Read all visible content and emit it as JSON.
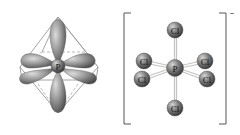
{
  "figure": {
    "left_panel": {
      "description": "sp3d2 hybrid orbitals of phosphorus in octahedral arrangement",
      "center_atom": "P",
      "orbital_color": "#8c8c8c",
      "edge_color": "#9a9a9a"
    },
    "right_panel": {
      "description": "Octahedral hexachlorophosphate ion",
      "center_atom": "P",
      "ligands": [
        "Cl",
        "Cl",
        "Cl",
        "Cl",
        "Cl",
        "Cl"
      ],
      "charge": "–",
      "atom_color": "#7a7a7a",
      "bond_color": "#c8c8c8"
    }
  }
}
